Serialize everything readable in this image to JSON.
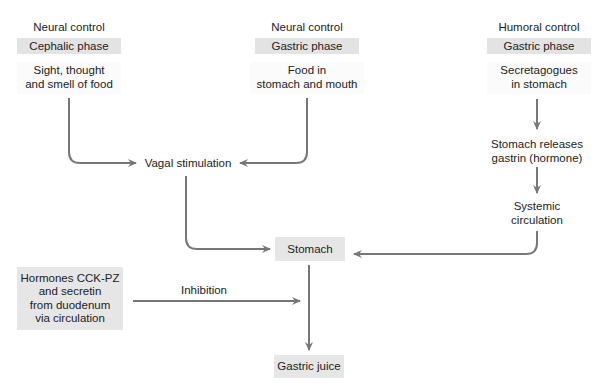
{
  "diagram": {
    "columns": [
      {
        "control": "Neural control",
        "phase": "Cephalic phase",
        "stimulus_line1": "Sight, thought",
        "stimulus_line2": "and smell of food"
      },
      {
        "control": "Neural control",
        "phase": "Gastric phase",
        "stimulus_line1": "Food in",
        "stimulus_line2": "stomach and mouth"
      },
      {
        "control": "Humoral control",
        "phase": "Gastric phase",
        "stimulus_line1": "Secretagogues",
        "stimulus_line2": "in stomach"
      }
    ],
    "humoral_steps": [
      {
        "line1": "Stomach releases",
        "line2": "gastrin (hormone)"
      },
      {
        "line1": "Systemic",
        "line2": "circulation"
      }
    ],
    "vagal": "Vagal stimulation",
    "stomach": "Stomach",
    "inhibitor": {
      "line1": "Hormones CCK-PZ",
      "line2": "and secretin",
      "line3": "from duodenum",
      "line4": "via circulation"
    },
    "inhibition_label": "Inhibition",
    "output": "Gastric juice",
    "colors": {
      "arrow": "#777777",
      "box": "#e3e3e3",
      "text": "#222222"
    }
  }
}
